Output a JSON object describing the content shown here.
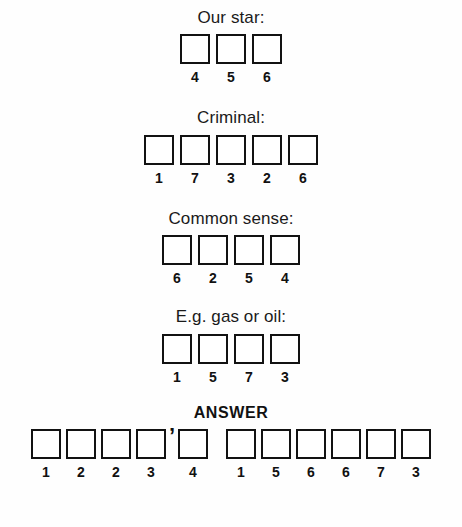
{
  "puzzle": {
    "answer_heading": "ANSWER",
    "apostrophe": "’",
    "clues": [
      {
        "label": "Our star:",
        "numbers": [
          "4",
          "5",
          "6"
        ]
      },
      {
        "label": "Criminal:",
        "numbers": [
          "1",
          "7",
          "3",
          "2",
          "6"
        ]
      },
      {
        "label": "Common sense:",
        "numbers": [
          "6",
          "2",
          "5",
          "4"
        ]
      },
      {
        "label": "E.g. gas or oil:",
        "numbers": [
          "1",
          "5",
          "7",
          "3"
        ]
      }
    ],
    "answer": {
      "word1": [
        "1",
        "2",
        "2",
        "3",
        "4"
      ],
      "word1_apostrophe_after_index": 3,
      "word2": [
        "1",
        "5",
        "6",
        "6",
        "7",
        "3"
      ]
    }
  }
}
